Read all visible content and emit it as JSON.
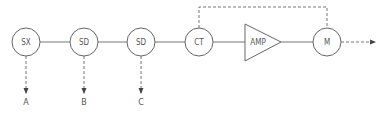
{
  "diagram": {
    "type": "signal-flow block diagram",
    "colors": {
      "stroke": "#666666",
      "text": "#555555",
      "background": "#ffffff"
    },
    "nodes": [
      {
        "id": "sx",
        "label": "SX",
        "shape": "circle"
      },
      {
        "id": "sd1",
        "label": "SD",
        "shape": "circle"
      },
      {
        "id": "sd2",
        "label": "SD",
        "shape": "circle"
      },
      {
        "id": "ct",
        "label": "CT",
        "shape": "circle"
      },
      {
        "id": "amp",
        "label": "AMP",
        "shape": "triangle"
      },
      {
        "id": "m",
        "label": "M",
        "shape": "circle"
      }
    ],
    "outputs": [
      {
        "from": "sx",
        "label": "A"
      },
      {
        "from": "sd1",
        "label": "B"
      },
      {
        "from": "sd2",
        "label": "C"
      }
    ],
    "edges": [
      {
        "from": "sx",
        "to": "sd1",
        "style": "solid"
      },
      {
        "from": "sd1",
        "to": "sd2",
        "style": "solid"
      },
      {
        "from": "sd2",
        "to": "ct",
        "style": "solid"
      },
      {
        "from": "ct",
        "to": "amp",
        "style": "solid"
      },
      {
        "from": "amp",
        "to": "m",
        "style": "solid"
      },
      {
        "from": "ct",
        "to": "m",
        "style": "dashed",
        "route": "over-top"
      },
      {
        "from": "m",
        "to": "output",
        "style": "dashed-arrow"
      }
    ]
  }
}
